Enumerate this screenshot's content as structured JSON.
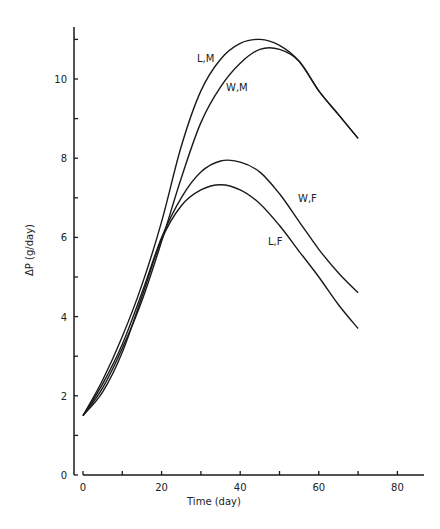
{
  "chart_data": {
    "type": "line",
    "title": "",
    "xlabel": "Time (day)",
    "ylabel": "ΔP (g/day)",
    "xlim": [
      0,
      85
    ],
    "ylim": [
      0,
      11.2
    ],
    "xticks": [
      0,
      10,
      20,
      30,
      40,
      50,
      60,
      70,
      80
    ],
    "xticklabels": [
      "0",
      "",
      "20",
      "",
      "40",
      "",
      "60",
      "",
      "80"
    ],
    "yticks": [
      0,
      1,
      2,
      3,
      4,
      5,
      6,
      7,
      8,
      9,
      10,
      11
    ],
    "yticklabels": [
      "0",
      "",
      "2",
      "",
      "4",
      "",
      "6",
      "",
      "8",
      "",
      "10",
      ""
    ],
    "grid": false,
    "legend": "inline labels next to curves",
    "series": [
      {
        "name": "L,M",
        "x": [
          0,
          5,
          10,
          15,
          20,
          25,
          30,
          35,
          40,
          45,
          50,
          55,
          60,
          65,
          70
        ],
        "values": [
          1.5,
          2.4,
          3.5,
          4.8,
          6.4,
          8.3,
          9.7,
          10.5,
          10.9,
          11.0,
          10.85,
          10.45,
          9.7,
          9.1,
          8.5
        ]
      },
      {
        "name": "W,M",
        "x": [
          0,
          5,
          10,
          15,
          20,
          25,
          30,
          35,
          40,
          45,
          50,
          55,
          60,
          65,
          70
        ],
        "values": [
          1.5,
          2.2,
          3.2,
          4.4,
          5.9,
          7.5,
          8.9,
          9.8,
          10.4,
          10.75,
          10.75,
          10.45,
          9.7,
          9.1,
          8.5
        ]
      },
      {
        "name": "W,F",
        "x": [
          0,
          5,
          10,
          15,
          20,
          25,
          30,
          35,
          40,
          45,
          50,
          55,
          60,
          65,
          70
        ],
        "values": [
          1.5,
          2.3,
          3.3,
          4.6,
          6.0,
          7.0,
          7.65,
          7.93,
          7.9,
          7.65,
          7.1,
          6.4,
          5.7,
          5.1,
          4.6
        ]
      },
      {
        "name": "L,F",
        "x": [
          0,
          5,
          10,
          15,
          20,
          25,
          30,
          35,
          40,
          45,
          50,
          55,
          60,
          65,
          70
        ],
        "values": [
          1.5,
          2.1,
          3.1,
          4.5,
          5.95,
          6.8,
          7.2,
          7.33,
          7.2,
          6.85,
          6.3,
          5.65,
          5.0,
          4.3,
          3.7
        ]
      }
    ],
    "annotations": [
      {
        "text": "L,M",
        "x": 197,
        "y": 62
      },
      {
        "text": "W,M",
        "x": 226,
        "y": 91
      },
      {
        "text": "W,F",
        "x": 298,
        "y": 202
      },
      {
        "text": "L,F",
        "x": 268,
        "y": 245
      }
    ]
  }
}
